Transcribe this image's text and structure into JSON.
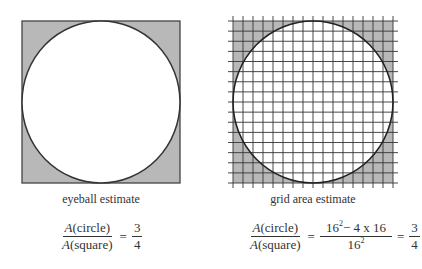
{
  "left_figure": {
    "caption": "eyeball estimate",
    "formula": {
      "lhs_num_var": "A",
      "lhs_num_arg": "(circle)",
      "lhs_den_var": "A",
      "lhs_den_arg": "(square)",
      "equals": "=",
      "rhs_num": "3",
      "rhs_den": "4"
    }
  },
  "right_figure": {
    "caption": "grid area estimate",
    "grid_cells": 16,
    "formula": {
      "lhs_num_var": "A",
      "lhs_num_arg": "(circle)",
      "lhs_den_var": "A",
      "lhs_den_arg": "(square)",
      "equals": "=",
      "mid_num_base": "16",
      "mid_num_exp": "2",
      "mid_num_rest": "− 4 x 16",
      "mid_den_base": "16",
      "mid_den_exp": "2",
      "equals2": "=",
      "rhs_num": "3",
      "rhs_den": "4"
    }
  },
  "colors": {
    "shade": "#b8b8b8",
    "stroke": "#333333",
    "background": "#ffffff"
  }
}
